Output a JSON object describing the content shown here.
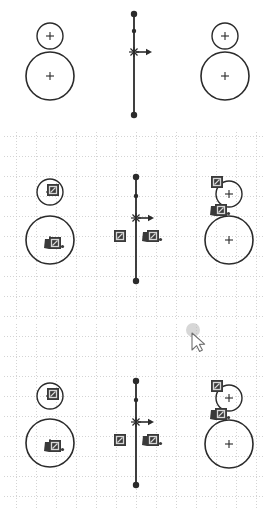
{
  "app": {
    "title": "CAD Sketch Canvas",
    "background_color": "#ffffff",
    "geometry_color": "#2b2b2b",
    "grid_color": "#c9c9c9",
    "badge_fill": "#3a3a3a",
    "badge_glyph_color": "#d8d8d8",
    "cursor_highlight_color": "#b0b0b0",
    "width": 269,
    "height": 510
  },
  "views": [
    {
      "name": "top-view",
      "label": "Preview (no grid)",
      "grid_visible": false,
      "badges_visible": false,
      "bounds": {
        "x": 0,
        "y": 0,
        "w": 269,
        "h": 128
      },
      "circles": [
        {
          "name": "left-small-circle",
          "cx": 50,
          "cy": 36,
          "r": 13,
          "stroke_width": 1.4,
          "center_mark": "plus"
        },
        {
          "name": "left-large-circle",
          "cx": 50,
          "cy": 76,
          "r": 24,
          "stroke_width": 1.6,
          "center_mark": "plus"
        },
        {
          "name": "right-small-circle",
          "cx": 225,
          "cy": 36,
          "r": 13,
          "stroke_width": 1.4,
          "center_mark": "plus"
        },
        {
          "name": "right-large-circle",
          "cx": 225,
          "cy": 76,
          "r": 24,
          "stroke_width": 1.6,
          "center_mark": "plus"
        }
      ],
      "axis": {
        "name": "vertical-axis",
        "x": 134,
        "y_top": 14,
        "y_bottom": 115,
        "endpoint_radius": 3.2,
        "mid_node_y": 31,
        "origin_y": 52,
        "origin_mark": "asterisk",
        "arrow": {
          "direction": "right",
          "from_x": 136,
          "to_x": 152,
          "y": 52
        }
      }
    },
    {
      "name": "middle-view",
      "label": "Sketch with grid and constraints",
      "grid_visible": true,
      "badges_visible": true,
      "bounds": {
        "x": 0,
        "y": 132,
        "w": 269,
        "h": 188
      },
      "circles": [
        {
          "name": "left-small-circle",
          "cx": 50,
          "cy": 192,
          "r": 13,
          "stroke_width": 1.4,
          "center_mark": "plus"
        },
        {
          "name": "left-large-circle",
          "cx": 50,
          "cy": 240,
          "r": 24,
          "stroke_width": 1.6,
          "center_mark": "plus"
        },
        {
          "name": "right-small-circle",
          "cx": 229,
          "cy": 194,
          "r": 13,
          "stroke_width": 1.4,
          "center_mark": "plus"
        },
        {
          "name": "right-large-circle",
          "cx": 229,
          "cy": 240,
          "r": 24,
          "stroke_width": 1.6,
          "center_mark": "plus"
        }
      ],
      "axis": {
        "name": "vertical-axis",
        "x": 136,
        "y_top": 177,
        "y_bottom": 281,
        "endpoint_radius": 3.2,
        "mid_node_y": 196,
        "origin_y": 218,
        "origin_mark": "asterisk",
        "arrow": {
          "direction": "right",
          "from_x": 138,
          "to_x": 154,
          "y": 218
        }
      },
      "badges": [
        {
          "name": "constraint-badge-left-small",
          "x": 47,
          "y": 184,
          "glyph": "lock-icon"
        },
        {
          "name": "constraint-badge-left-large",
          "x": 49,
          "y": 237,
          "glyph": "lock-tail-icon",
          "tail": true
        },
        {
          "name": "constraint-badge-center-left",
          "x": 114,
          "y": 230,
          "glyph": "lock-icon"
        },
        {
          "name": "constraint-badge-center-right",
          "x": 147,
          "y": 230,
          "glyph": "lock-tail-icon",
          "tail": true
        },
        {
          "name": "constraint-badge-right-top",
          "x": 211,
          "y": 176,
          "glyph": "lock-icon"
        },
        {
          "name": "constraint-badge-right-mid",
          "x": 215,
          "y": 204,
          "glyph": "lock-tail-icon",
          "tail": true
        }
      ]
    },
    {
      "name": "bottom-view",
      "label": "Sketch with grid, constraints and pointer",
      "grid_visible": true,
      "badges_visible": true,
      "bounds": {
        "x": 0,
        "y": 324,
        "w": 269,
        "h": 186
      },
      "circles": [
        {
          "name": "left-small-circle",
          "cx": 50,
          "cy": 396,
          "r": 13,
          "stroke_width": 1.4,
          "center_mark": "plus"
        },
        {
          "name": "left-large-circle",
          "cx": 50,
          "cy": 443,
          "r": 24,
          "stroke_width": 1.6,
          "center_mark": "plus"
        },
        {
          "name": "right-small-circle",
          "cx": 229,
          "cy": 398,
          "r": 13,
          "stroke_width": 1.4,
          "center_mark": "plus"
        },
        {
          "name": "right-large-circle",
          "cx": 229,
          "cy": 444,
          "r": 24,
          "stroke_width": 1.6,
          "center_mark": "plus"
        }
      ],
      "axis": {
        "name": "vertical-axis",
        "x": 136,
        "y_top": 381,
        "y_bottom": 485,
        "endpoint_radius": 3.2,
        "mid_node_y": 400,
        "origin_y": 422,
        "origin_mark": "asterisk",
        "arrow": {
          "direction": "right",
          "from_x": 138,
          "to_x": 154,
          "y": 422
        }
      },
      "badges": [
        {
          "name": "constraint-badge-left-small",
          "x": 47,
          "y": 388,
          "glyph": "lock-icon"
        },
        {
          "name": "constraint-badge-left-large",
          "x": 49,
          "y": 440,
          "glyph": "lock-tail-icon",
          "tail": true
        },
        {
          "name": "constraint-badge-center-left",
          "x": 114,
          "y": 434,
          "glyph": "lock-icon"
        },
        {
          "name": "constraint-badge-center-right",
          "x": 147,
          "y": 434,
          "glyph": "lock-tail-icon",
          "tail": true
        },
        {
          "name": "constraint-badge-right-top",
          "x": 211,
          "y": 380,
          "glyph": "lock-icon"
        },
        {
          "name": "constraint-badge-right-mid",
          "x": 215,
          "y": 408,
          "glyph": "lock-tail-icon",
          "tail": true
        }
      ]
    }
  ],
  "grid": {
    "name": "dashed-grid",
    "cell_size": 20,
    "origin_x": 16,
    "origin_y": 136,
    "line_color": "#c9c9c9",
    "dash": "1,2",
    "stroke_width": 0.8
  },
  "cursor": {
    "name": "mouse-pointer",
    "x": 191,
    "y": 329,
    "tip_x": 192,
    "tip_y": 333,
    "click_highlight": {
      "cx": 193,
      "cy": 330,
      "r": 7,
      "color": "#b6b6b6",
      "opacity": 0.55
    },
    "color": "#6f6f6f",
    "label": "pointer"
  }
}
